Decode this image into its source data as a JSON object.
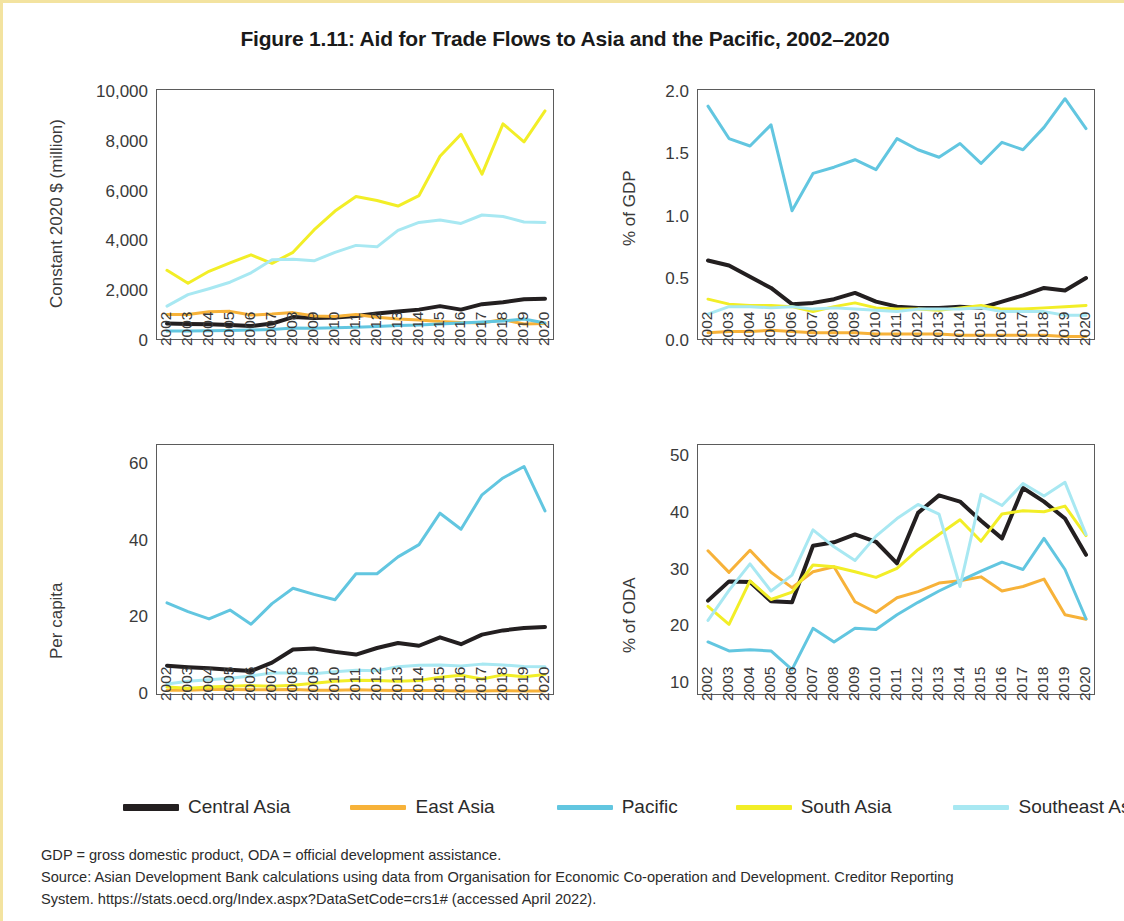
{
  "figure": {
    "title": "Figure 1.11: Aid for Trade Flows to Asia and the Pacific, 2002–2020",
    "border_color": "#f3e3a0"
  },
  "legend": {
    "position": "bottom",
    "items": [
      {
        "label": "Central Asia",
        "color": "#231f20"
      },
      {
        "label": "East Asia",
        "color": "#f7b239"
      },
      {
        "label": "Pacific",
        "color": "#62c6e0"
      },
      {
        "label": "South Asia",
        "color": "#f2ee27"
      },
      {
        "label": "Southeast Asia",
        "color": "#a8e8f2"
      }
    ]
  },
  "notes": {
    "line1": "GDP = gross domestic product, ODA = official development assistance.",
    "line2": "Source: Asian Development Bank calculations using data from Organisation for Economic Co-operation and Development. Creditor Reporting",
    "line3": "System. https://stats.oecd.org/Index.aspx?DataSetCode=crs1# (accessed April 2022)."
  },
  "chart_data": [
    {
      "id": "constant-dollars",
      "type": "line",
      "title": "",
      "xlabel": "",
      "ylabel": "Constant 2020 $ (million)",
      "x": [
        2002,
        2003,
        2004,
        2005,
        2006,
        2007,
        2008,
        2009,
        2010,
        2011,
        2012,
        2013,
        2014,
        2015,
        2016,
        2017,
        2018,
        2019,
        2020
      ],
      "categories": [
        "2002",
        "2003",
        "2004",
        "2005",
        "2006",
        "2007",
        "2008",
        "2009",
        "2010",
        "2011",
        "2012",
        "2013",
        "2014",
        "2015",
        "2016",
        "2017",
        "2018",
        "2019",
        "2020"
      ],
      "ylim": [
        0,
        10000
      ],
      "yticks": [
        0,
        2000,
        4000,
        6000,
        8000,
        10000
      ],
      "ytick_labels": [
        "0",
        "2,000",
        "4,000",
        "6,000",
        "8,000",
        "10,000"
      ],
      "grid": false,
      "series": [
        {
          "name": "Central Asia",
          "color": "#231f20",
          "values": [
            620,
            600,
            590,
            560,
            520,
            620,
            880,
            840,
            860,
            920,
            1020,
            1100,
            1180,
            1320,
            1180,
            1400,
            1480,
            1600,
            1620
          ]
        },
        {
          "name": "East Asia",
          "color": "#f7b239",
          "values": [
            980,
            980,
            1090,
            1110,
            960,
            1000,
            1060,
            920,
            900,
            980,
            870,
            800,
            760,
            700,
            660,
            640,
            780,
            600,
            620
          ]
        },
        {
          "name": "Pacific",
          "color": "#62c6e0",
          "values": [
            320,
            320,
            330,
            340,
            360,
            380,
            440,
            430,
            450,
            470,
            500,
            540,
            560,
            600,
            640,
            680,
            720,
            800,
            640
          ]
        },
        {
          "name": "South Asia",
          "color": "#f2ee27",
          "values": [
            2760,
            2240,
            2720,
            3060,
            3380,
            3040,
            3480,
            4380,
            5140,
            5720,
            5560,
            5340,
            5760,
            7340,
            8220,
            6620,
            8640,
            7920,
            9160
          ]
        },
        {
          "name": "Southeast Asia",
          "color": "#a8e8f2",
          "values": [
            1320,
            1780,
            2020,
            2280,
            2660,
            3180,
            3200,
            3140,
            3480,
            3760,
            3700,
            4360,
            4680,
            4780,
            4640,
            4980,
            4920,
            4700,
            4680
          ]
        }
      ]
    },
    {
      "id": "percent-gdp",
      "type": "line",
      "title": "",
      "xlabel": "",
      "ylabel": "% of GDP",
      "x": [
        2002,
        2003,
        2004,
        2005,
        2006,
        2007,
        2008,
        2009,
        2010,
        2011,
        2012,
        2013,
        2014,
        2015,
        2016,
        2017,
        2018,
        2019,
        2020
      ],
      "categories": [
        "2002",
        "2003",
        "2004",
        "2005",
        "2006",
        "2007",
        "2008",
        "2009",
        "2010",
        "2011",
        "2012",
        "2013",
        "2014",
        "2015",
        "2016",
        "2017",
        "2018",
        "2019",
        "2020"
      ],
      "ylim": [
        0.0,
        2.0
      ],
      "yticks": [
        0.0,
        0.5,
        1.0,
        1.5,
        2.0
      ],
      "ytick_labels": [
        "0.0",
        "0.5",
        "1.0",
        "1.5",
        "2.0"
      ],
      "grid": false,
      "series": [
        {
          "name": "Central Asia",
          "color": "#231f20",
          "values": [
            0.63,
            0.59,
            0.5,
            0.41,
            0.28,
            0.29,
            0.32,
            0.37,
            0.3,
            0.26,
            0.25,
            0.25,
            0.26,
            0.25,
            0.3,
            0.35,
            0.41,
            0.39,
            0.49
          ]
        },
        {
          "name": "East Asia",
          "color": "#f7b239",
          "values": [
            0.05,
            0.06,
            0.06,
            0.07,
            0.06,
            0.05,
            0.05,
            0.05,
            0.04,
            0.04,
            0.04,
            0.04,
            0.03,
            0.03,
            0.03,
            0.03,
            0.03,
            0.02,
            0.02
          ]
        },
        {
          "name": "Pacific",
          "color": "#62c6e0",
          "values": [
            1.87,
            1.61,
            1.55,
            1.72,
            1.03,
            1.33,
            1.38,
            1.44,
            1.36,
            1.61,
            1.52,
            1.46,
            1.57,
            1.41,
            1.58,
            1.52,
            1.7,
            1.93,
            1.69
          ]
        },
        {
          "name": "South Asia",
          "color": "#f2ee27",
          "values": [
            0.32,
            0.28,
            0.27,
            0.27,
            0.26,
            0.22,
            0.26,
            0.29,
            0.25,
            0.24,
            0.24,
            0.23,
            0.25,
            0.27,
            0.24,
            0.24,
            0.25,
            0.26,
            0.27
          ]
        },
        {
          "name": "Southeast Asia",
          "color": "#a8e8f2",
          "values": [
            0.2,
            0.26,
            0.26,
            0.25,
            0.26,
            0.24,
            0.25,
            0.24,
            0.23,
            0.22,
            0.24,
            0.24,
            0.24,
            0.25,
            0.22,
            0.22,
            0.22,
            0.19,
            0.19
          ]
        }
      ]
    },
    {
      "id": "per-capita",
      "type": "line",
      "title": "",
      "xlabel": "",
      "ylabel": "Per capita",
      "x": [
        2002,
        2003,
        2004,
        2005,
        2006,
        2007,
        2008,
        2009,
        2010,
        2011,
        2012,
        2013,
        2014,
        2015,
        2016,
        2017,
        2018,
        2019,
        2020
      ],
      "categories": [
        "2002",
        "2003",
        "2004",
        "2005",
        "2006",
        "2007",
        "2008",
        "2009",
        "2010",
        "2011",
        "2012",
        "2013",
        "2014",
        "2015",
        "2016",
        "2017",
        "2018",
        "2019",
        "2020"
      ],
      "ylim": [
        0,
        65
      ],
      "yticks": [
        0,
        20,
        40,
        60
      ],
      "ytick_labels": [
        "0",
        "20",
        "40",
        "60"
      ],
      "grid": false,
      "series": [
        {
          "name": "Central Asia",
          "color": "#231f20",
          "values": [
            7.4,
            7.0,
            6.7,
            6.3,
            6.0,
            8.2,
            11.6,
            11.9,
            11.0,
            10.3,
            12.0,
            13.3,
            12.6,
            14.8,
            13.0,
            15.5,
            16.6,
            17.2,
            17.5
          ]
        },
        {
          "name": "East Asia",
          "color": "#f7b239",
          "values": [
            1.0,
            1.0,
            1.2,
            1.2,
            1.1,
            1.1,
            1.2,
            1.0,
            1.0,
            1.1,
            1.0,
            0.9,
            0.9,
            0.9,
            0.8,
            0.8,
            0.9,
            0.8,
            0.8
          ]
        },
        {
          "name": "Pacific",
          "color": "#62c6e0",
          "values": [
            23.8,
            21.5,
            19.6,
            21.9,
            18.2,
            23.6,
            27.6,
            26.0,
            24.6,
            31.4,
            31.4,
            35.8,
            39.0,
            47.2,
            43.0,
            52.0,
            56.4,
            59.4,
            47.8
          ]
        },
        {
          "name": "South Asia",
          "color": "#f2ee27",
          "values": [
            1.8,
            1.5,
            1.8,
            2.0,
            2.2,
            2.0,
            2.3,
            2.8,
            3.3,
            3.6,
            3.5,
            3.3,
            3.5,
            4.4,
            4.9,
            3.9,
            5.0,
            4.5,
            5.1
          ]
        },
        {
          "name": "Southeast Asia",
          "color": "#a8e8f2",
          "values": [
            2.6,
            3.3,
            3.7,
            4.1,
            4.7,
            5.5,
            5.5,
            5.3,
            5.8,
            6.2,
            6.1,
            7.1,
            7.5,
            7.6,
            7.3,
            7.8,
            7.6,
            7.2,
            7.1
          ]
        }
      ]
    },
    {
      "id": "percent-oda",
      "type": "line",
      "title": "",
      "xlabel": "",
      "ylabel": "% of ODA",
      "x": [
        2002,
        2003,
        2004,
        2005,
        2006,
        2007,
        2008,
        2009,
        2010,
        2011,
        2012,
        2013,
        2014,
        2015,
        2016,
        2017,
        2018,
        2019,
        2020
      ],
      "categories": [
        "2002",
        "2003",
        "2004",
        "2005",
        "2006",
        "2007",
        "2008",
        "2009",
        "2010",
        "2011",
        "2012",
        "2013",
        "2014",
        "2015",
        "2016",
        "2017",
        "2018",
        "2019",
        "2020"
      ],
      "ylim": [
        8,
        52
      ],
      "yticks": [
        10,
        20,
        30,
        40,
        50
      ],
      "ytick_labels": [
        "10",
        "20",
        "30",
        "40",
        "50"
      ],
      "grid": false,
      "series": [
        {
          "name": "Central Asia",
          "color": "#231f20",
          "values": [
            24.5,
            27.9,
            27.8,
            24.4,
            24.2,
            34.2,
            34.8,
            36.2,
            34.9,
            31.1,
            40.0,
            43.1,
            42.0,
            38.6,
            35.5,
            44.4,
            42.0,
            39.0,
            32.6
          ]
        },
        {
          "name": "East Asia",
          "color": "#f7b239",
          "values": [
            33.3,
            29.5,
            33.4,
            29.5,
            26.8,
            29.6,
            30.5,
            24.3,
            22.4,
            25.0,
            26.1,
            27.6,
            28.0,
            28.7,
            26.2,
            27.0,
            28.3,
            22.0,
            21.2
          ]
        },
        {
          "name": "Pacific",
          "color": "#62c6e0",
          "values": [
            17.2,
            15.6,
            15.8,
            15.6,
            12.3,
            19.6,
            17.2,
            19.6,
            19.4,
            22.0,
            24.2,
            26.2,
            28.0,
            29.7,
            31.3,
            30.0,
            35.5,
            30.0,
            21.3
          ]
        },
        {
          "name": "South Asia",
          "color": "#f2ee27",
          "values": [
            23.5,
            20.3,
            28.0,
            24.7,
            26.0,
            30.8,
            30.5,
            29.6,
            28.6,
            30.2,
            33.5,
            36.2,
            38.8,
            35.0,
            39.8,
            40.4,
            40.2,
            41.2,
            36.0
          ]
        },
        {
          "name": "Southeast Asia",
          "color": "#a8e8f2",
          "values": [
            21.0,
            26.3,
            31.0,
            26.2,
            29.0,
            37.0,
            34.0,
            31.6,
            35.9,
            39.0,
            41.5,
            39.8,
            27.0,
            43.3,
            41.3,
            45.2,
            43.0,
            45.4,
            36.2
          ]
        }
      ]
    }
  ]
}
